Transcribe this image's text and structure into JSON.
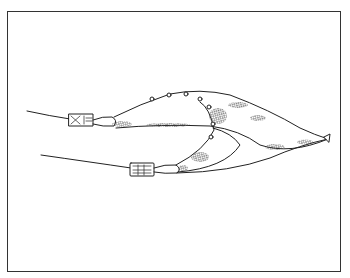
{
  "figure": {
    "colors": {
      "ink": "#222222",
      "background": "#ffffff",
      "frame": "#333333"
    }
  }
}
